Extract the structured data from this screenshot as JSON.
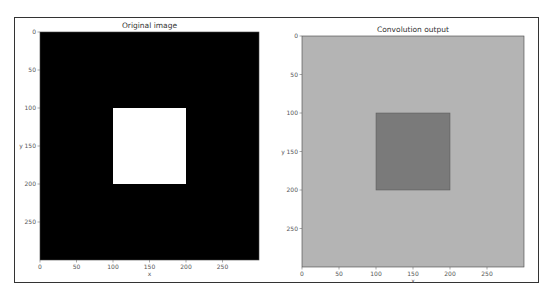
{
  "chart_data": [
    {
      "type": "heatmap",
      "title": "Original image",
      "xlabel": "x",
      "ylabel": "y",
      "xlim": [
        0,
        300
      ],
      "ylim": [
        300,
        0
      ],
      "xticks": [
        0,
        50,
        100,
        150,
        200,
        250
      ],
      "yticks": [
        0,
        50,
        100,
        150,
        200,
        250
      ],
      "background_value": 0,
      "background_color": "#000000",
      "regions": [
        {
          "x0": 100,
          "x1": 200,
          "y0": 100,
          "y1": 200,
          "value": 1,
          "color": "#ffffff"
        }
      ],
      "colormap": "gray"
    },
    {
      "type": "heatmap",
      "title": "Convolution output",
      "xlabel": "x",
      "ylabel": "y",
      "xlim": [
        0,
        300
      ],
      "ylim": [
        300,
        0
      ],
      "xticks": [
        0,
        50,
        100,
        150,
        200,
        250
      ],
      "yticks": [
        0,
        50,
        100,
        150,
        200,
        250
      ],
      "background_color": "#b4b4b4",
      "regions": [
        {
          "x0": 100,
          "x1": 200,
          "y0": 100,
          "y1": 200,
          "color": "#7a7a7a"
        }
      ],
      "colormap": "gray"
    }
  ]
}
